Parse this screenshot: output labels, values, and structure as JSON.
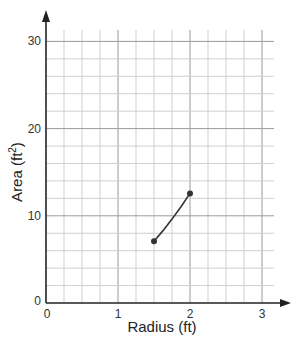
{
  "chart_data": {
    "type": "line",
    "title": "",
    "xlabel": "Radius (ft)",
    "ylabel": "Area (ft²)",
    "ylabel_parts": {
      "text": "Area (ft",
      "sup": "2",
      "close": ")"
    },
    "xlim": [
      0,
      3.25
    ],
    "ylim": [
      0,
      31
    ],
    "x_ticks": [
      0,
      1,
      2,
      3
    ],
    "x_tick_labels": [
      "0",
      "1",
      "2",
      "3"
    ],
    "y_ticks": [
      0,
      10,
      20,
      30
    ],
    "y_tick_labels": [
      "0",
      "10",
      "20",
      "30"
    ],
    "grid": true,
    "x_minor_step": 0.25,
    "y_minor_step": 2,
    "legend": null,
    "series": [
      {
        "name": "Area vs Radius",
        "x": [
          1.5,
          1.625,
          1.75,
          1.875,
          2.0
        ],
        "y": [
          7.07,
          8.3,
          9.62,
          11.04,
          12.57
        ],
        "endpoints": [
          [
            1.5,
            7.07
          ],
          [
            2.0,
            12.57
          ]
        ],
        "color": "#333333"
      }
    ]
  },
  "colors": {
    "axis": "#222222",
    "grid_major": "#9a9a9a",
    "grid_minor": "#cfcfcf",
    "curve": "#333333"
  }
}
